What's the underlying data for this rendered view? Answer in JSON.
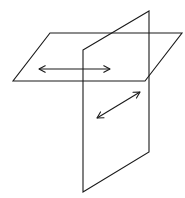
{
  "diagram": {
    "stroke_color": "#1a1a1a",
    "background": "#ffffff",
    "planes": [
      {
        "name": "horizontal-plane",
        "points": [
          [
            50,
            33
          ],
          [
            182,
            33
          ],
          [
            145,
            81
          ],
          [
            13,
            81
          ]
        ]
      },
      {
        "name": "vertical-plane",
        "points": [
          [
            83,
            50
          ],
          [
            149,
            11
          ],
          [
            149,
            152
          ],
          [
            83,
            192
          ]
        ]
      }
    ],
    "arrows": [
      {
        "name": "horizontal-arrow",
        "from": [
          39,
          69
        ],
        "to": [
          110,
          69
        ],
        "double_headed": true
      },
      {
        "name": "diagonal-arrow",
        "from": [
          97,
          118
        ],
        "to": [
          140,
          92
        ],
        "double_headed": true
      }
    ]
  }
}
